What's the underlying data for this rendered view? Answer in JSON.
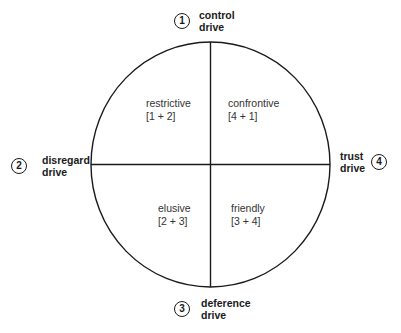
{
  "diagram": {
    "type": "quadrant-circle",
    "stroke_color": "#1a1a1a",
    "drives": [
      {
        "number": "1",
        "line1": "control",
        "line2": "drive",
        "position": "top"
      },
      {
        "number": "2",
        "line1": "disregard",
        "line2": "drive",
        "position": "left"
      },
      {
        "number": "3",
        "line1": "deference",
        "line2": "drive",
        "position": "bottom"
      },
      {
        "number": "4",
        "line1": "trust",
        "line2": "drive",
        "position": "right"
      }
    ],
    "quadrants": [
      {
        "name": "restrictive",
        "combo": "[1 + 2]",
        "position": "top-left"
      },
      {
        "name": "confrontive",
        "combo": "[4 + 1]",
        "position": "top-right"
      },
      {
        "name": "elusive",
        "combo": "[2 + 3]",
        "position": "bottom-left"
      },
      {
        "name": "friendly",
        "combo": "[3 + 4]",
        "position": "bottom-right"
      }
    ]
  }
}
